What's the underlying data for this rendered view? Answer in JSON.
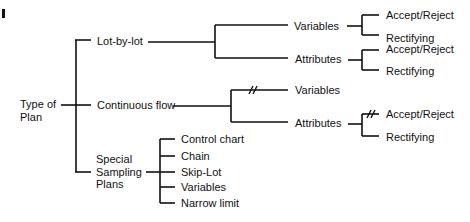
{
  "diagram": {
    "root": {
      "line1": "Type of",
      "line2": "Plan"
    },
    "branches": {
      "lot_by_lot": {
        "label": "Lot-by-lot",
        "variables": {
          "label": "Variables",
          "accept_reject": "Accept/Reject",
          "rectifying": "Rectifying"
        },
        "attributes": {
          "label": "Attributes",
          "accept_reject": "Accept/Reject",
          "rectifying": "Rectifying"
        }
      },
      "continuous_flow": {
        "label": "Continuous flow",
        "variables": {
          "label": "Variables",
          "break_mark": "//"
        },
        "attributes": {
          "label": "Attributes",
          "accept_reject": "Accept/Reject",
          "rectifying": "Rectifying",
          "break_mark": "//"
        }
      },
      "special_sampling": {
        "line1": "Special",
        "line2": "Sampling",
        "line3": "Plans",
        "items": [
          "Control chart",
          "Chain",
          "Skip-Lot",
          "Variables",
          "Narrow limit"
        ]
      }
    },
    "colors": {
      "line": "#111111",
      "background": "#ffffff"
    }
  }
}
